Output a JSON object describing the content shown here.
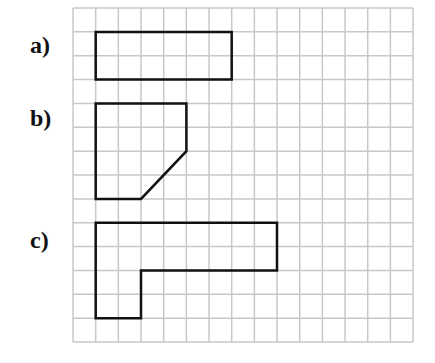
{
  "grid": {
    "cols": 15,
    "rows": 14,
    "origin_x": 73,
    "origin_y": 8,
    "cell_w": 22.67,
    "cell_h": 23.86,
    "line_color": "#c8c8c8",
    "shape_color": "#111111"
  },
  "figures": [
    {
      "label": "a)",
      "label_x": 30,
      "label_y": 33,
      "points": [
        [
          1,
          1
        ],
        [
          7,
          1
        ],
        [
          7,
          3
        ],
        [
          1,
          3
        ]
      ]
    },
    {
      "label": "b)",
      "label_x": 30,
      "label_y": 106,
      "points": [
        [
          1,
          4
        ],
        [
          5,
          4
        ],
        [
          5,
          6
        ],
        [
          3,
          8
        ],
        [
          1,
          8
        ]
      ]
    },
    {
      "label": "c)",
      "label_x": 30,
      "label_y": 228,
      "points": [
        [
          1,
          9
        ],
        [
          9,
          9
        ],
        [
          9,
          11
        ],
        [
          3,
          11
        ],
        [
          3,
          13
        ],
        [
          1,
          13
        ]
      ]
    }
  ]
}
